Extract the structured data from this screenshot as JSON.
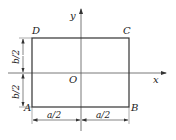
{
  "diagram": {
    "type": "rectangle-coordinate-figure",
    "axes": {
      "x_label": "x",
      "y_label": "y",
      "origin_label": "O"
    },
    "corners": {
      "top_left": "D",
      "top_right": "C",
      "bottom_left": "A",
      "bottom_right": "B"
    },
    "dimensions": {
      "horizontal_left": "a/2",
      "horizontal_right": "a/2",
      "vertical_top": "b/2",
      "vertical_bottom": "b/2"
    },
    "colors": {
      "line": "#333333",
      "axis": "#555555",
      "background": "#ffffff"
    }
  }
}
